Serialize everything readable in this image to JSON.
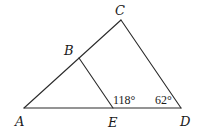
{
  "diagram": {
    "type": "geometry-triangle",
    "points": {
      "A": {
        "label": "A",
        "x": 24,
        "y": 108,
        "lx": 15,
        "ly": 126
      },
      "B": {
        "label": "B",
        "x": 79,
        "y": 58,
        "lx": 64,
        "ly": 55
      },
      "C": {
        "label": "C",
        "x": 121,
        "y": 20,
        "lx": 115,
        "ly": 15
      },
      "D": {
        "label": "D",
        "x": 181,
        "y": 108,
        "lx": 180,
        "ly": 126
      },
      "E": {
        "label": "E",
        "x": 113,
        "y": 108,
        "lx": 108,
        "ly": 127
      }
    },
    "segments": [
      {
        "from": "A",
        "to": "C"
      },
      {
        "from": "C",
        "to": "D"
      },
      {
        "from": "A",
        "to": "D"
      },
      {
        "from": "B",
        "to": "E"
      }
    ],
    "angles": {
      "at_E": {
        "text": "118°",
        "x": 113,
        "y": 104
      },
      "at_D": {
        "text": "62°",
        "x": 155,
        "y": 104
      }
    }
  }
}
